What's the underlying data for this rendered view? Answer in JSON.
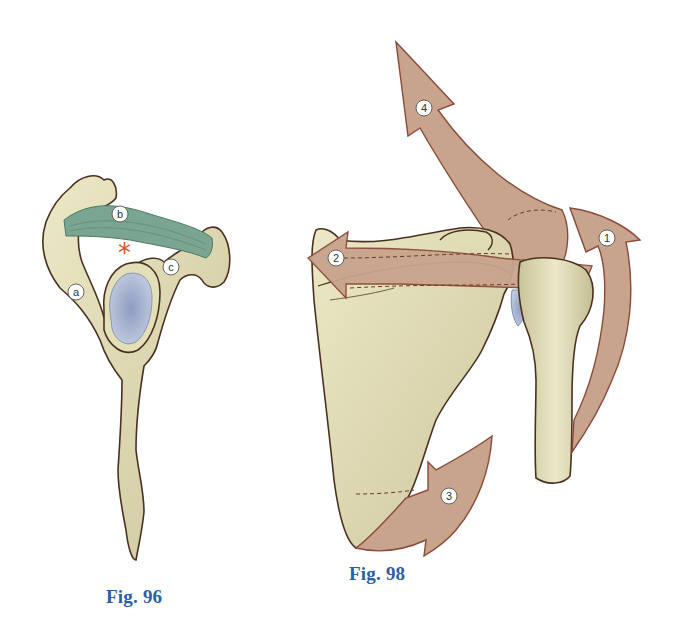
{
  "figures": [
    {
      "id": "fig96",
      "caption": "Fig. 96",
      "view": "lateral view of scapula showing coracoacromial arch",
      "labels": [
        {
          "key": "a",
          "text": "a"
        },
        {
          "key": "b",
          "text": "b"
        },
        {
          "key": "c",
          "text": "c"
        }
      ],
      "marker": "*",
      "marker_color": "#d9532b"
    },
    {
      "id": "fig98",
      "caption": "Fig. 98",
      "view": "posterior view of scapula and humerus with movement arrows",
      "arrows": [
        {
          "num": "1"
        },
        {
          "num": "2"
        },
        {
          "num": "3"
        },
        {
          "num": "4"
        }
      ]
    }
  ],
  "colors": {
    "bone": "#e3dfb8",
    "bone_shadow": "#c9c39a",
    "outline": "#4a3020",
    "ligament": "#7aa590",
    "glenoid": "#a9b6d3",
    "arrow_fill": "#c8a48c",
    "arrow_outline": "#8a4a3a",
    "caption": "#2a5ea8"
  }
}
